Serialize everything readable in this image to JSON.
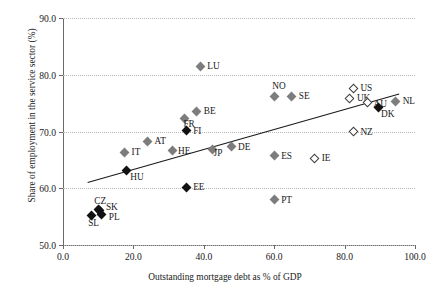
{
  "chart_data": {
    "type": "scatter",
    "title": "",
    "xlabel": "Outstanding mortgage debt as % of GDP",
    "ylabel": "Share of employment in the service sector (%)",
    "xlim": [
      0.0,
      100.0
    ],
    "ylim": [
      50.0,
      90.0
    ],
    "xticks": [
      "0.0",
      "20.0",
      "40.0",
      "60.0",
      "80.0",
      "100.0"
    ],
    "xtick_values": [
      0,
      20,
      40,
      60,
      80,
      100
    ],
    "yticks": [
      "50.0",
      "60.0",
      "70.0",
      "80.0",
      "90.0"
    ],
    "ytick_values": [
      50,
      60,
      70,
      80,
      90
    ],
    "grid": "horizontal-dotted",
    "legend": "none",
    "points": [
      {
        "label": "LU",
        "x": 39.0,
        "y": 81.5,
        "marker": "fill-gray",
        "lx": 7,
        "ly": -5
      },
      {
        "label": "US",
        "x": 82.5,
        "y": 77.6,
        "marker": "fill-open",
        "lx": 7,
        "ly": -5
      },
      {
        "label": "NO",
        "x": 60.0,
        "y": 76.2,
        "marker": "fill-gray",
        "lx": -2,
        "ly": -15
      },
      {
        "label": "SE",
        "x": 65.0,
        "y": 76.2,
        "marker": "fill-gray",
        "lx": 7,
        "ly": -5
      },
      {
        "label": "UK",
        "x": 81.5,
        "y": 75.9,
        "marker": "fill-open",
        "lx": 7,
        "ly": -5
      },
      {
        "label": "NL",
        "x": 94.5,
        "y": 75.3,
        "marker": "fill-gray",
        "lx": 7,
        "ly": -5
      },
      {
        "label": "AU",
        "x": 86.5,
        "y": 75.1,
        "marker": "fill-open",
        "lx": 6,
        "ly": -4
      },
      {
        "label": "DK",
        "x": 89.5,
        "y": 74.3,
        "marker": "fill-black",
        "lx": 3,
        "ly": 2
      },
      {
        "label": "BE",
        "x": 38.0,
        "y": 73.6,
        "marker": "fill-gray",
        "lx": 7,
        "ly": -5
      },
      {
        "label": "FR",
        "x": 34.5,
        "y": 72.3,
        "marker": "fill-gray",
        "lx": -1,
        "ly": 1
      },
      {
        "label": "FI",
        "x": 35.0,
        "y": 70.1,
        "marker": "fill-black",
        "lx": 7,
        "ly": -5
      },
      {
        "label": "NZ",
        "x": 82.5,
        "y": 70.0,
        "marker": "fill-open",
        "lx": 7,
        "ly": -5
      },
      {
        "label": "AT",
        "x": 24.0,
        "y": 68.3,
        "marker": "fill-gray",
        "lx": 7,
        "ly": -5
      },
      {
        "label": "DE",
        "x": 48.0,
        "y": 67.3,
        "marker": "fill-gray",
        "lx": 6,
        "ly": -5
      },
      {
        "label": "JP",
        "x": 42.5,
        "y": 66.9,
        "marker": "fill-gray",
        "lx": 1,
        "ly": -1
      },
      {
        "label": "HE",
        "x": 31.0,
        "y": 66.6,
        "marker": "fill-gray",
        "lx": 6,
        "ly": -5
      },
      {
        "label": "IT",
        "x": 17.5,
        "y": 66.3,
        "marker": "fill-gray",
        "lx": 7,
        "ly": -5
      },
      {
        "label": "ES",
        "x": 60.0,
        "y": 65.7,
        "marker": "fill-gray",
        "lx": 7,
        "ly": -5
      },
      {
        "label": "IE",
        "x": 71.5,
        "y": 65.3,
        "marker": "fill-open",
        "lx": 7,
        "ly": -5
      },
      {
        "label": "HU",
        "x": 18.0,
        "y": 63.1,
        "marker": "fill-black",
        "lx": 4,
        "ly": 1
      },
      {
        "label": "EE",
        "x": 35.0,
        "y": 60.2,
        "marker": "fill-black",
        "lx": 7,
        "ly": -5
      },
      {
        "label": "PT",
        "x": 60.0,
        "y": 58.0,
        "marker": "fill-gray",
        "lx": 7,
        "ly": -5
      },
      {
        "label": "CZ",
        "x": 10.0,
        "y": 56.2,
        "marker": "fill-black",
        "lx": -4,
        "ly": -14
      },
      {
        "label": "SK",
        "x": 10.5,
        "y": 56.0,
        "marker": "fill-black",
        "lx": 6,
        "ly": -9
      },
      {
        "label": "PL",
        "x": 11.0,
        "y": 55.4,
        "marker": "fill-black",
        "lx": 7,
        "ly": -2
      },
      {
        "label": "SL",
        "x": 8.0,
        "y": 55.2,
        "marker": "fill-black",
        "lx": -3,
        "ly": 3
      }
    ],
    "trendline": {
      "x1": 7.0,
      "y1": 61.0,
      "x2": 95.5,
      "y2": 76.6,
      "color": "#1a1a1a"
    }
  }
}
